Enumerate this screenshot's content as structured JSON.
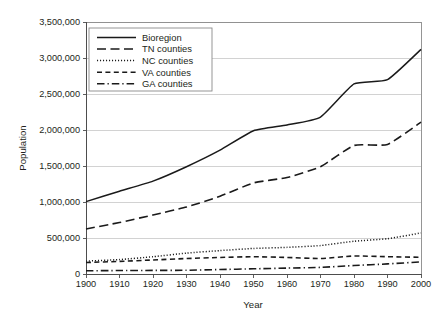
{
  "chart_data": {
    "type": "line",
    "title": "",
    "xlabel": "Year",
    "ylabel": "Population",
    "x": [
      1900,
      1910,
      1920,
      1930,
      1940,
      1950,
      1960,
      1970,
      1980,
      1990,
      2000
    ],
    "xticklabels": [
      "1900",
      "1910",
      "1920",
      "1930",
      "1940",
      "1950",
      "1960",
      "1970",
      "1980",
      "1990",
      "2000"
    ],
    "yticklabels": [
      "0",
      "500,000",
      "1,000,000",
      "1,500,000",
      "2,000,000",
      "2,500,000",
      "3,000,000",
      "3,500,000"
    ],
    "yticks": [
      0,
      500000,
      1000000,
      1500000,
      2000000,
      2500000,
      3000000,
      3500000
    ],
    "xlim": [
      1900,
      2000
    ],
    "ylim": [
      0,
      3500000
    ],
    "grid": "horizontal",
    "legend_position": "upper-left-inside",
    "series": [
      {
        "name": "Bioregion",
        "style": "solid",
        "color": "#1a1a1a",
        "values": [
          1005000,
          1150000,
          1290000,
          1490000,
          1720000,
          1990000,
          2070000,
          2180000,
          2640000,
          2700000,
          3120000
        ]
      },
      {
        "name": "TN counties",
        "style": "long-dash",
        "color": "#1a1a1a",
        "values": [
          625000,
          715000,
          820000,
          930000,
          1080000,
          1265000,
          1340000,
          1490000,
          1785000,
          1800000,
          2110000
        ]
      },
      {
        "name": "NC counties",
        "style": "dotted",
        "color": "#1a1a1a",
        "values": [
          180000,
          200000,
          240000,
          290000,
          325000,
          355000,
          370000,
          395000,
          455000,
          490000,
          570000
        ]
      },
      {
        "name": "VA counties",
        "style": "dashed",
        "color": "#1a1a1a",
        "values": [
          160000,
          175000,
          195000,
          215000,
          230000,
          240000,
          230000,
          215000,
          250000,
          240000,
          232000
        ]
      },
      {
        "name": "GA counties",
        "style": "dash-dot",
        "color": "#1a1a1a",
        "values": [
          45000,
          48000,
          50000,
          52000,
          62000,
          72000,
          82000,
          92000,
          118000,
          140000,
          168000
        ]
      }
    ]
  },
  "legend": {
    "entries": [
      {
        "label": "Bioregion"
      },
      {
        "label": "TN counties"
      },
      {
        "label": "NC counties"
      },
      {
        "label": "VA counties"
      },
      {
        "label": "GA counties"
      }
    ]
  },
  "colors": {
    "line": "#1a1a1a",
    "grid": "#bfbfbf",
    "frame": "#8a8a8a",
    "text": "#231f20",
    "background": "#ffffff"
  }
}
